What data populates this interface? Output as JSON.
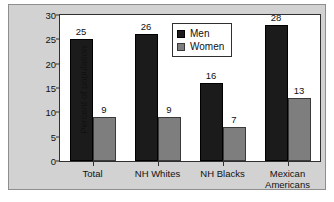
{
  "chart_data": {
    "type": "bar",
    "title": "",
    "xlabel": "",
    "ylabel": "Percent of population",
    "ylim": [
      0,
      30
    ],
    "yticks": [
      0,
      5,
      10,
      15,
      20,
      25,
      30
    ],
    "ytick_labels": [
      "0",
      "5",
      "10",
      "15",
      "20",
      "25",
      "30"
    ],
    "grid": false,
    "legend_position": "top-center-right",
    "categories": [
      "Total",
      "NH Whites",
      "NH Blacks",
      "Mexican Americans"
    ],
    "category_lines": [
      [
        "Total"
      ],
      [
        "NH Whites"
      ],
      [
        "NH Blacks"
      ],
      [
        "Mexican",
        "Americans"
      ]
    ],
    "series": [
      {
        "name": "Men",
        "color": "#1b1b1b",
        "values": [
          25,
          26,
          16,
          28
        ],
        "labels": [
          "25",
          "26",
          "16",
          "28"
        ]
      },
      {
        "name": "Women",
        "color": "#7e7e7e",
        "values": [
          9,
          9,
          7,
          13
        ],
        "labels": [
          "9",
          "9",
          "7",
          "13"
        ]
      }
    ]
  },
  "legend": {
    "entries": [
      {
        "label": "Men",
        "swatch": "men"
      },
      {
        "label": "Women",
        "swatch": "women"
      }
    ]
  },
  "colors": {
    "panel_background": "#d2d2d2",
    "plot_background": "#ffffff",
    "axis": "#303030",
    "men": "#1b1b1b",
    "women": "#7e7e7e",
    "text": "#111111"
  }
}
